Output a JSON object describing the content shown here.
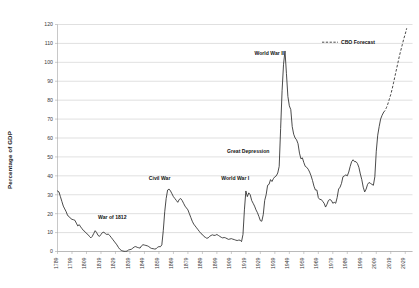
{
  "chart_data": {
    "type": "line",
    "title": "",
    "xlabel": "",
    "ylabel": "Percentage of GDP",
    "ylim": [
      0,
      120
    ],
    "ytick_step": 10,
    "xlim": [
      1789,
      2034
    ],
    "grid": true,
    "legend_position": "top-right",
    "yticks": [
      "0",
      "10",
      "20",
      "30",
      "40",
      "50",
      "60",
      "70",
      "80",
      "90",
      "100",
      "110",
      "120"
    ],
    "xticks": [
      "1789",
      "1799",
      "1809",
      "1819",
      "1829",
      "1839",
      "1849",
      "1859",
      "1869",
      "1879",
      "1889",
      "1899",
      "1909",
      "1919",
      "1929",
      "1939",
      "1949",
      "1959",
      "1969",
      "1979",
      "1989",
      "1999",
      "2009",
      "2019",
      "2029"
    ],
    "series": [
      {
        "name": "Debt Held by the Public",
        "style": "solid",
        "color": "#2b2b2b",
        "points": [
          [
            1789,
            32.0
          ],
          [
            1790,
            31.5
          ],
          [
            1791,
            29.0
          ],
          [
            1792,
            26.5
          ],
          [
            1793,
            24.0
          ],
          [
            1794,
            22.5
          ],
          [
            1795,
            21.0
          ],
          [
            1796,
            19.0
          ],
          [
            1797,
            18.5
          ],
          [
            1798,
            17.5
          ],
          [
            1799,
            17.0
          ],
          [
            1800,
            16.8
          ],
          [
            1801,
            16.5
          ],
          [
            1802,
            15.0
          ],
          [
            1803,
            13.5
          ],
          [
            1804,
            14.2
          ],
          [
            1805,
            13.0
          ],
          [
            1806,
            12.0
          ],
          [
            1807,
            11.0
          ],
          [
            1808,
            10.5
          ],
          [
            1809,
            9.5
          ],
          [
            1810,
            9.0
          ],
          [
            1811,
            8.0
          ],
          [
            1812,
            7.2
          ],
          [
            1813,
            8.0
          ],
          [
            1814,
            9.5
          ],
          [
            1815,
            11.0
          ],
          [
            1816,
            10.0
          ],
          [
            1817,
            8.5
          ],
          [
            1818,
            8.0
          ],
          [
            1819,
            9.0
          ],
          [
            1820,
            10.0
          ],
          [
            1821,
            10.2
          ],
          [
            1822,
            9.5
          ],
          [
            1823,
            9.0
          ],
          [
            1824,
            9.2
          ],
          [
            1825,
            8.5
          ],
          [
            1826,
            7.5
          ],
          [
            1827,
            6.5
          ],
          [
            1828,
            5.5
          ],
          [
            1829,
            4.5
          ],
          [
            1830,
            3.5
          ],
          [
            1831,
            2.2
          ],
          [
            1832,
            1.2
          ],
          [
            1833,
            0.6
          ],
          [
            1834,
            0.3
          ],
          [
            1835,
            0.1
          ],
          [
            1836,
            0.1
          ],
          [
            1837,
            0.2
          ],
          [
            1838,
            0.8
          ],
          [
            1839,
            1.0
          ],
          [
            1840,
            1.2
          ],
          [
            1841,
            1.8
          ],
          [
            1842,
            2.4
          ],
          [
            1843,
            2.6
          ],
          [
            1844,
            2.2
          ],
          [
            1845,
            2.0
          ],
          [
            1846,
            1.8
          ],
          [
            1847,
            3.0
          ],
          [
            1848,
            3.6
          ],
          [
            1849,
            3.4
          ],
          [
            1850,
            3.2
          ],
          [
            1851,
            3.0
          ],
          [
            1852,
            2.6
          ],
          [
            1853,
            2.0
          ],
          [
            1854,
            1.6
          ],
          [
            1855,
            1.5
          ],
          [
            1856,
            1.3
          ],
          [
            1857,
            1.4
          ],
          [
            1858,
            2.2
          ],
          [
            1859,
            2.6
          ],
          [
            1860,
            2.5
          ],
          [
            1861,
            3.5
          ],
          [
            1862,
            11.0
          ],
          [
            1863,
            21.0
          ],
          [
            1864,
            28.0
          ],
          [
            1865,
            32.5
          ],
          [
            1866,
            33.0
          ],
          [
            1867,
            32.0
          ],
          [
            1868,
            30.5
          ],
          [
            1869,
            29.0
          ],
          [
            1870,
            28.0
          ],
          [
            1871,
            27.0
          ],
          [
            1872,
            26.0
          ],
          [
            1873,
            27.5
          ],
          [
            1874,
            28.0
          ],
          [
            1875,
            27.0
          ],
          [
            1876,
            25.5
          ],
          [
            1877,
            24.0
          ],
          [
            1878,
            23.0
          ],
          [
            1879,
            22.0
          ],
          [
            1880,
            20.0
          ],
          [
            1881,
            18.0
          ],
          [
            1882,
            16.0
          ],
          [
            1883,
            14.5
          ],
          [
            1884,
            13.5
          ],
          [
            1885,
            12.5
          ],
          [
            1886,
            11.5
          ],
          [
            1887,
            10.5
          ],
          [
            1888,
            9.5
          ],
          [
            1889,
            9.0
          ],
          [
            1890,
            8.0
          ],
          [
            1891,
            7.5
          ],
          [
            1892,
            7.0
          ],
          [
            1893,
            7.2
          ],
          [
            1894,
            8.0
          ],
          [
            1895,
            8.5
          ],
          [
            1896,
            8.8
          ],
          [
            1897,
            8.5
          ],
          [
            1898,
            8.6
          ],
          [
            1899,
            9.0
          ],
          [
            1900,
            8.5
          ],
          [
            1901,
            8.0
          ],
          [
            1902,
            7.5
          ],
          [
            1903,
            7.2
          ],
          [
            1904,
            7.4
          ],
          [
            1905,
            7.2
          ],
          [
            1906,
            6.8
          ],
          [
            1907,
            6.4
          ],
          [
            1908,
            6.6
          ],
          [
            1909,
            6.8
          ],
          [
            1910,
            6.5
          ],
          [
            1911,
            6.3
          ],
          [
            1912,
            6.0
          ],
          [
            1913,
            5.8
          ],
          [
            1914,
            6.0
          ],
          [
            1915,
            6.0
          ],
          [
            1916,
            5.2
          ],
          [
            1917,
            9.0
          ],
          [
            1918,
            22.0
          ],
          [
            1919,
            32.0
          ],
          [
            1920,
            29.0
          ],
          [
            1921,
            31.0
          ],
          [
            1922,
            30.0
          ],
          [
            1923,
            27.0
          ],
          [
            1924,
            25.5
          ],
          [
            1925,
            24.0
          ],
          [
            1926,
            22.0
          ],
          [
            1927,
            20.5
          ],
          [
            1928,
            18.5
          ],
          [
            1929,
            16.3
          ],
          [
            1930,
            16.0
          ],
          [
            1931,
            19.5
          ],
          [
            1932,
            27.0
          ],
          [
            1933,
            30.0
          ],
          [
            1934,
            35.0
          ],
          [
            1935,
            35.5
          ],
          [
            1936,
            38.0
          ],
          [
            1937,
            37.0
          ],
          [
            1938,
            38.5
          ],
          [
            1939,
            39.5
          ],
          [
            1940,
            40.0
          ],
          [
            1941,
            41.5
          ],
          [
            1942,
            45.0
          ],
          [
            1943,
            65.0
          ],
          [
            1944,
            85.0
          ],
          [
            1945,
            99.0
          ],
          [
            1946,
            106.0
          ],
          [
            1947,
            94.0
          ],
          [
            1948,
            82.0
          ],
          [
            1949,
            77.0
          ],
          [
            1950,
            75.0
          ],
          [
            1951,
            66.0
          ],
          [
            1952,
            62.0
          ],
          [
            1953,
            60.0
          ],
          [
            1954,
            59.0
          ],
          [
            1955,
            57.0
          ],
          [
            1956,
            52.0
          ],
          [
            1957,
            49.0
          ],
          [
            1958,
            49.5
          ],
          [
            1959,
            47.0
          ],
          [
            1960,
            45.0
          ],
          [
            1961,
            44.5
          ],
          [
            1962,
            43.5
          ],
          [
            1963,
            42.0
          ],
          [
            1964,
            40.0
          ],
          [
            1965,
            37.5
          ],
          [
            1966,
            34.5
          ],
          [
            1967,
            32.5
          ],
          [
            1968,
            32.5
          ],
          [
            1969,
            28.5
          ],
          [
            1970,
            27.5
          ],
          [
            1971,
            27.5
          ],
          [
            1972,
            26.5
          ],
          [
            1973,
            25.5
          ],
          [
            1974,
            23.5
          ],
          [
            1975,
            25.0
          ],
          [
            1976,
            27.0
          ],
          [
            1977,
            27.5
          ],
          [
            1978,
            27.0
          ],
          [
            1979,
            25.5
          ],
          [
            1980,
            26.0
          ],
          [
            1981,
            25.5
          ],
          [
            1982,
            28.5
          ],
          [
            1983,
            33.0
          ],
          [
            1984,
            34.0
          ],
          [
            1985,
            36.0
          ],
          [
            1986,
            39.5
          ],
          [
            1987,
            40.0
          ],
          [
            1988,
            40.5
          ],
          [
            1989,
            40.0
          ],
          [
            1990,
            42.0
          ],
          [
            1991,
            45.0
          ],
          [
            1992,
            47.5
          ],
          [
            1993,
            48.5
          ],
          [
            1994,
            47.5
          ],
          [
            1995,
            47.5
          ],
          [
            1996,
            46.5
          ],
          [
            1997,
            44.5
          ],
          [
            1998,
            41.0
          ],
          [
            1999,
            38.0
          ],
          [
            2000,
            34.0
          ],
          [
            2001,
            31.5
          ],
          [
            2002,
            33.0
          ],
          [
            2003,
            35.5
          ],
          [
            2004,
            36.5
          ],
          [
            2005,
            36.0
          ],
          [
            2006,
            35.5
          ],
          [
            2007,
            35.0
          ],
          [
            2008,
            39.5
          ],
          [
            2009,
            53.0
          ],
          [
            2010,
            61.5
          ],
          [
            2011,
            66.0
          ],
          [
            2012,
            70.0
          ],
          [
            2013,
            72.0
          ],
          [
            2014,
            73.5
          ]
        ]
      },
      {
        "name": "CBO Forecast",
        "style": "dashed",
        "color": "#2b2b2b",
        "points": [
          [
            2014,
            73.5
          ],
          [
            2015,
            74.5
          ],
          [
            2016,
            76.0
          ],
          [
            2017,
            78.0
          ],
          [
            2018,
            80.5
          ],
          [
            2019,
            83.0
          ],
          [
            2020,
            86.0
          ],
          [
            2021,
            89.5
          ],
          [
            2022,
            93.0
          ],
          [
            2023,
            96.5
          ],
          [
            2024,
            100.0
          ],
          [
            2025,
            103.5
          ],
          [
            2026,
            106.5
          ],
          [
            2027,
            109.5
          ],
          [
            2028,
            112.5
          ],
          [
            2029,
            115.0
          ],
          [
            2030,
            118.0
          ]
        ]
      }
    ],
    "annotations": [
      {
        "label": "War of 1812",
        "x": 1817,
        "y": 17
      },
      {
        "label": "Civil War",
        "x": 1852,
        "y": 38
      },
      {
        "label": "World War I",
        "x": 1902,
        "y": 38
      },
      {
        "label": "Great Depression",
        "x": 1906,
        "y": 52
      },
      {
        "label": "World War II",
        "x": 1925,
        "y": 104
      }
    ],
    "legend": [
      {
        "label": "CBO Forecast",
        "style": "dashed"
      }
    ]
  }
}
